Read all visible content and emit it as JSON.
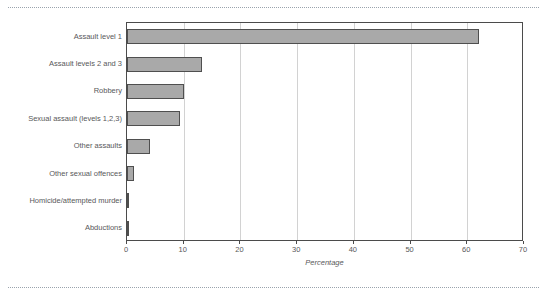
{
  "chart_data": {
    "type": "bar",
    "orientation": "horizontal",
    "title": "",
    "subtitle": "",
    "xlabel": "Percentage",
    "ylabel": "",
    "xlim": [
      0,
      70
    ],
    "xticks": [
      0,
      10,
      20,
      30,
      40,
      50,
      60,
      70
    ],
    "xtick_labels": [
      "0",
      "10",
      "20",
      "30",
      "40",
      "50",
      "60",
      "70"
    ],
    "grid": "vertical",
    "legend": "none",
    "categories": [
      "Assault level 1",
      "Assault levels 2 and 3",
      "Robbery",
      "Sexual assault (levels 1,2,3)",
      "Other assaults",
      "Other sexual offences",
      "Homicide/attempted murder",
      "Abductions"
    ],
    "values": [
      62.0,
      13.2,
      10.1,
      9.3,
      4.1,
      1.3,
      0.3,
      0.3
    ],
    "series": [
      {
        "name": "Percentage",
        "values": [
          62.0,
          13.2,
          10.1,
          9.3,
          4.1,
          1.3,
          0.3,
          0.3
        ]
      }
    ],
    "colors": {
      "bar_fill": "#a9a9a9",
      "bar_border": "#4f4f4f",
      "gridline": "#d2d2d2",
      "axis": "#4b4b4b",
      "text": "#58585a",
      "rule": "#9aa3ad",
      "background": "#ffffff"
    }
  }
}
